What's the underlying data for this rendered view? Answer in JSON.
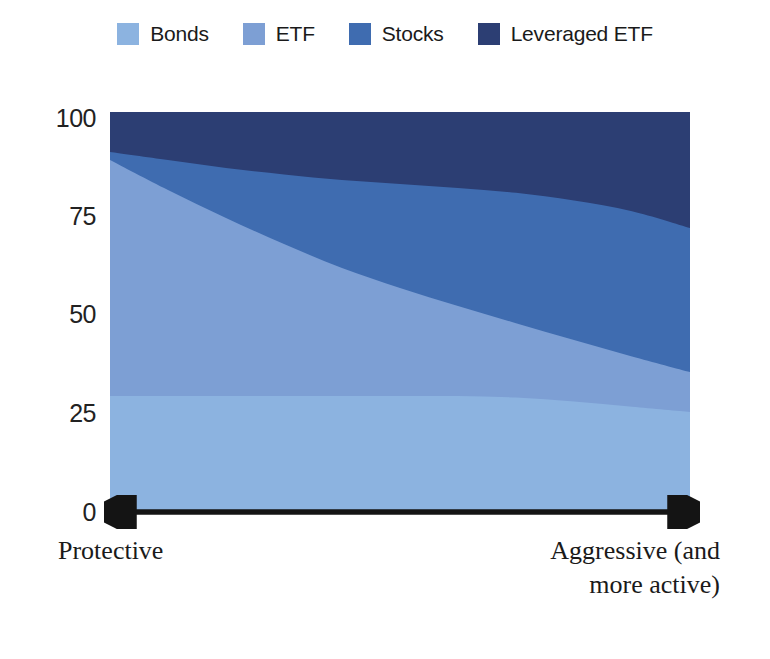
{
  "chart_data": {
    "type": "area",
    "title": "",
    "subtitle": "",
    "xlabel": "",
    "ylabel": "",
    "stacked": true,
    "grid": false,
    "legend_position": "top",
    "ylim": [
      0,
      100
    ],
    "yticks": [
      "0",
      "25",
      "50",
      "75",
      "100"
    ],
    "ytick_values": [
      0,
      25,
      50,
      75,
      100
    ],
    "x": [
      0,
      10,
      20,
      30,
      40,
      50,
      60,
      70,
      80,
      90,
      100
    ],
    "x_axis_endpoints": [
      "Protective",
      "Aggressive (and more active)"
    ],
    "series": [
      {
        "name": "Bonds",
        "color": "#8cb3e0",
        "values": [
          29,
          29,
          29,
          29,
          29,
          29,
          29,
          28.6,
          27.6,
          26.3,
          25
        ]
      },
      {
        "name": "ETF",
        "color": "#7d9fd4",
        "values": [
          59,
          51.5,
          44.5,
          38,
          32,
          27,
          22.5,
          18.6,
          15.4,
          12.6,
          10
        ]
      },
      {
        "name": "Stocks",
        "color": "#3f6cb0",
        "values": [
          2,
          7.5,
          12.5,
          17.4,
          22,
          26,
          29.5,
          32.6,
          34.9,
          36.3,
          36
        ]
      },
      {
        "name": "Leveraged ETF",
        "color": "#2c3e73",
        "values": [
          10,
          12,
          14,
          15.6,
          17,
          18,
          19,
          20.2,
          22.1,
          24.8,
          29
        ]
      }
    ],
    "cumulative_boundaries": {
      "bonds_top": [
        29,
        29,
        29,
        29,
        29,
        29,
        29,
        28.6,
        27.6,
        26.3,
        25
      ],
      "etf_top": [
        88,
        80.5,
        73.5,
        67,
        61,
        56,
        51.5,
        47.2,
        43,
        38.9,
        35
      ],
      "stocks_top": [
        90,
        88,
        86,
        84.4,
        83,
        82,
        81,
        79.8,
        77.9,
        75.2,
        71
      ],
      "leveraged_top": [
        100,
        100,
        100,
        100,
        100,
        100,
        100,
        100,
        100,
        100,
        100
      ]
    }
  },
  "legend": {
    "items": [
      {
        "label": "Bonds",
        "color": "#8cb3e0"
      },
      {
        "label": "ETF",
        "color": "#7d9fd4"
      },
      {
        "label": "Stocks",
        "color": "#3f6cb0"
      },
      {
        "label": "Leveraged ETF",
        "color": "#2c3e73"
      }
    ]
  },
  "y_axis": {
    "ticks": [
      {
        "label": "100"
      },
      {
        "label": "75"
      },
      {
        "label": "50"
      },
      {
        "label": "25"
      },
      {
        "label": "0"
      }
    ]
  },
  "x_axis": {
    "left_label": "Protective",
    "right_label_line1": "Aggressive (and",
    "right_label_line2": "more active)",
    "arrow_color": "#1a1a1a"
  }
}
